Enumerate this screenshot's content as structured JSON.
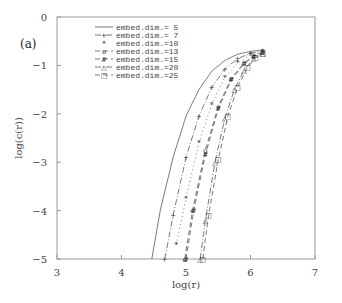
{
  "chart_data": {
    "type": "line",
    "panel_label": "(a)",
    "title": "",
    "xlabel": "log(r)",
    "ylabel": "log(c(r))",
    "xlim": [
      3,
      7
    ],
    "ylim": [
      -5,
      0
    ],
    "xticks": [
      3,
      4,
      5,
      6,
      7
    ],
    "yticks": [
      0,
      -1,
      -2,
      -3,
      -4,
      -5
    ],
    "grid": false,
    "legend_position": "upper center",
    "series": [
      {
        "name": "embed.dim.= 5",
        "style": "solid",
        "marker": "",
        "x": [
          4.47,
          4.6,
          4.8,
          5.0,
          5.2,
          5.4,
          5.6,
          5.8,
          6.0,
          6.19
        ],
        "y": [
          -5.0,
          -4.0,
          -2.9,
          -2.05,
          -1.5,
          -1.12,
          -0.9,
          -0.77,
          -0.71,
          -0.68
        ]
      },
      {
        "name": "embed.dim.= 7",
        "style": "dash-dot",
        "marker": "+",
        "x": [
          4.67,
          4.8,
          5.0,
          5.2,
          5.4,
          5.6,
          5.8,
          6.0,
          6.19
        ],
        "y": [
          -5.0,
          -4.1,
          -2.9,
          -2.05,
          -1.45,
          -1.08,
          -0.86,
          -0.75,
          -0.7
        ]
      },
      {
        "name": "embed.dim.=10",
        "style": "none",
        "marker": "*",
        "x": [
          4.85,
          5.0,
          5.2,
          5.4,
          5.6,
          5.8,
          6.0,
          6.19
        ],
        "y": [
          -4.7,
          -3.75,
          -2.6,
          -1.8,
          -1.25,
          -0.95,
          -0.78,
          -0.72
        ]
      },
      {
        "name": "embed.dim.=13",
        "style": "dash",
        "marker": "o",
        "x": [
          4.98,
          5.1,
          5.3,
          5.5,
          5.7,
          5.9,
          6.05,
          6.19
        ],
        "y": [
          -5.0,
          -4.0,
          -2.75,
          -1.85,
          -1.27,
          -0.95,
          -0.8,
          -0.73
        ]
      },
      {
        "name": "embed.dim.=15",
        "style": "dash",
        "marker": "#",
        "x": [
          5.0,
          5.12,
          5.3,
          5.5,
          5.7,
          5.9,
          6.05,
          6.19
        ],
        "y": [
          -5.0,
          -4.0,
          -2.85,
          -1.9,
          -1.3,
          -0.97,
          -0.81,
          -0.74
        ]
      },
      {
        "name": "embed.dim.=20",
        "style": "dash-dot",
        "marker": "△",
        "x": [
          5.22,
          5.3,
          5.45,
          5.6,
          5.75,
          5.9,
          6.05,
          6.19
        ],
        "y": [
          -5.0,
          -4.2,
          -3.0,
          -2.1,
          -1.5,
          -1.1,
          -0.86,
          -0.75
        ]
      },
      {
        "name": "embed.dim.=25",
        "style": "dash",
        "marker": "□",
        "x": [
          5.26,
          5.35,
          5.5,
          5.65,
          5.8,
          5.95,
          6.08,
          6.19
        ],
        "y": [
          -5.0,
          -4.1,
          -2.95,
          -2.05,
          -1.45,
          -1.05,
          -0.84,
          -0.76
        ]
      }
    ]
  }
}
